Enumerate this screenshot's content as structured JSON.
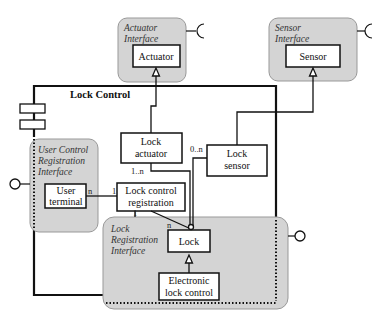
{
  "diagram": {
    "component_title": "Lock Control",
    "interfaces": {
      "actuator": {
        "line1": "Actuator",
        "line2": "Interface",
        "class": "Actuator"
      },
      "sensor": {
        "line1": "Sensor",
        "line2": "Interface",
        "class": "Sensor"
      },
      "user_control": {
        "line1": "User Control",
        "line2": "Registration",
        "line3": "Interface",
        "class_line1": "User",
        "class_line2": "terminal"
      },
      "lock_registration": {
        "line1": "Lock",
        "line2": "Registration",
        "line3": "Interface"
      }
    },
    "classes": {
      "lock_actuator": {
        "line1": "Lock",
        "line2": "actuator"
      },
      "lock_sensor": {
        "line1": "Lock",
        "line2": "sensor"
      },
      "lock_control_registration": {
        "line1": "Lock control",
        "line2": "registration"
      },
      "lock": {
        "label": "Lock"
      },
      "electronic_lock_control": {
        "line1": "Electronic",
        "line2": "lock control"
      }
    },
    "multiplicities": {
      "actuator_lock": "1..n",
      "sensor_lock": "0..n",
      "user_terminal_side": "n",
      "registration_side": "1",
      "registration_bottom": "1",
      "lock_side": "n"
    },
    "colors": {
      "interface_fill": "#d4d4d4",
      "line": "#111111",
      "box_fill": "#ffffff"
    }
  }
}
